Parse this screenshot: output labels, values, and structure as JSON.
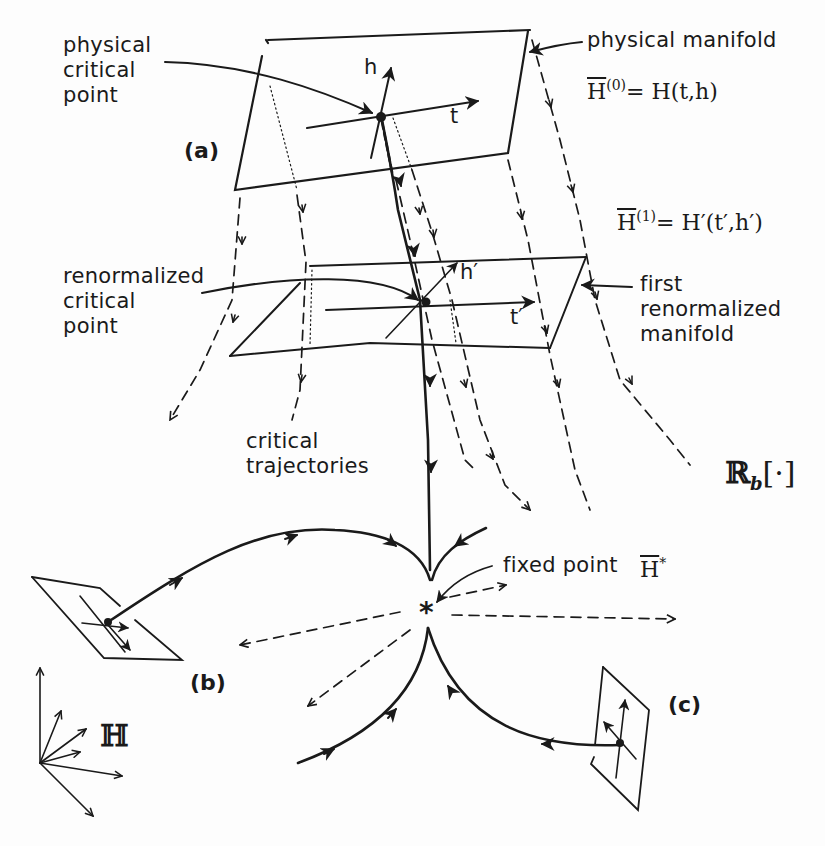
{
  "diagram": {
    "type": "renormalization-group flow schematic",
    "labels": {
      "physical_critical_point": "physical\ncritical\npoint",
      "physical_manifold": "physical manifold",
      "h0_lhs": "H",
      "h0_sup": "(0)",
      "h0_rhs": "= H(t,h)",
      "h1_lhs": "H",
      "h1_sup": "(1)",
      "h1_rhs": "= H′(t′,h′)",
      "renormalized_critical_point": "renormalized\ncritical\npoint",
      "first_renormalized_manifold": "first\nrenormalized\nmanifold",
      "critical_trajectories": "critical\ntrajectories",
      "fixed_point": "fixed point",
      "fixed_point_symbol": "H",
      "fixed_point_sup": "*",
      "rg_operator": "ℝ",
      "rg_operator_sub": "b",
      "rg_operator_arg": "[·]",
      "space_label": "ℍ",
      "axis_t": "t",
      "axis_h": "h",
      "axis_t_prime": "t′",
      "axis_h_prime": "h′",
      "tag_a": "(a)",
      "tag_b": "(b)",
      "tag_c": "(c)",
      "fixed_point_marker": "*"
    },
    "colors": {
      "ink": "#1a1a1a",
      "background": "#fdfdfd"
    }
  }
}
